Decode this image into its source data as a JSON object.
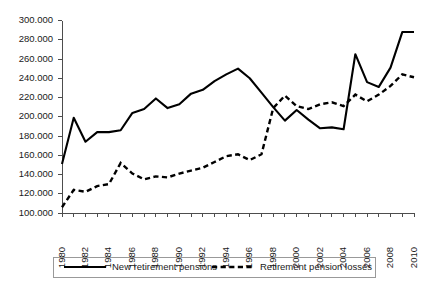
{
  "chart_data": {
    "type": "line",
    "title": "",
    "subtitle": "",
    "xlabel": "",
    "ylabel": "",
    "grid": false,
    "legend_position": "bottom",
    "xlim": [
      1980,
      2010
    ],
    "ylim": [
      100000,
      300000
    ],
    "x": [
      1980,
      1981,
      1982,
      1983,
      1984,
      1985,
      1986,
      1987,
      1988,
      1989,
      1990,
      1991,
      1992,
      1993,
      1994,
      1995,
      1996,
      1997,
      1998,
      1999,
      2000,
      2001,
      2002,
      2003,
      2004,
      2005,
      2006,
      2007,
      2008,
      2009,
      2010
    ],
    "x_tick_labels": [
      "1980",
      "1982",
      "1984",
      "1986",
      "1988",
      "1990",
      "1992",
      "1994",
      "1996",
      "1998",
      "2000",
      "2002",
      "2004",
      "2006",
      "2008",
      "2010"
    ],
    "y_tick_labels": [
      "100.000",
      "120.000",
      "140.000",
      "160.000",
      "180.000",
      "200.000",
      "220.000",
      "240.000",
      "260.000",
      "280.000",
      "300.000"
    ],
    "y_tick_values": [
      100000,
      120000,
      140000,
      160000,
      180000,
      200000,
      220000,
      240000,
      260000,
      280000,
      300000
    ],
    "series": [
      {
        "name": "New retirement pensions",
        "style": "solid",
        "color": "#000000",
        "values": [
          151000,
          199000,
          174000,
          184000,
          184000,
          186000,
          204000,
          208000,
          219000,
          209000,
          213000,
          224000,
          228000,
          237000,
          244000,
          250000,
          240000,
          225000,
          210000,
          196000,
          207000,
          197000,
          188000,
          189000,
          187000,
          265000,
          236000,
          231000,
          251000,
          288000,
          288000
        ]
      },
      {
        "name": "Retirement pension losses",
        "style": "dashed",
        "color": "#000000",
        "values": [
          106000,
          124000,
          122000,
          128000,
          130000,
          152000,
          141000,
          135000,
          138000,
          137000,
          141000,
          144000,
          147000,
          153000,
          159000,
          161000,
          155000,
          161000,
          209000,
          222000,
          211000,
          208000,
          213000,
          215000,
          211000,
          223000,
          216000,
          223000,
          232000,
          244000,
          241000
        ]
      }
    ]
  },
  "legend": {
    "entries": [
      {
        "label": "New retirement pensions",
        "style": "solid"
      },
      {
        "label": "Retirement pension losses",
        "style": "dashed"
      }
    ]
  }
}
